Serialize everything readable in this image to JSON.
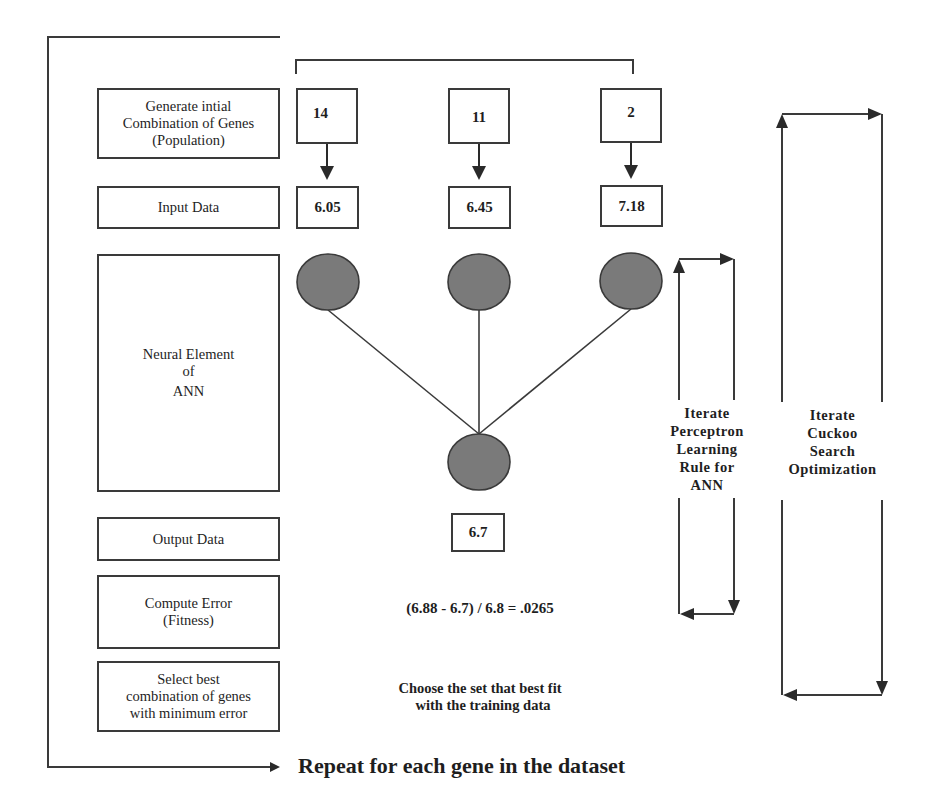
{
  "diagram": {
    "title_bottom": "Repeat for each gene in the dataset",
    "steps": [
      {
        "id": "generate",
        "lines": [
          "Generate intial",
          "Combination of Genes",
          "(Population)"
        ]
      },
      {
        "id": "input",
        "lines": [
          "Input Data"
        ]
      },
      {
        "id": "neural",
        "lines": [
          "Neural Element",
          "of",
          "ANN"
        ]
      },
      {
        "id": "output",
        "lines": [
          "Output Data"
        ]
      },
      {
        "id": "error",
        "lines": [
          "Compute Error",
          "(Fitness)"
        ]
      },
      {
        "id": "select",
        "lines": [
          "Select best",
          "combination of genes",
          "with minimum error"
        ]
      }
    ],
    "genes": [
      "14",
      "11",
      "2"
    ],
    "inputs": [
      "6.05",
      "6.45",
      "7.18"
    ],
    "neurons": {
      "input_count": 3,
      "output_count": 1,
      "fill_color": "#7a7a7a"
    },
    "output_value": "6.7",
    "error_formula": "(6.88 - 6.7) / 6.8 = .0265",
    "select_note": [
      "Choose the set that best fit",
      "with the training data"
    ],
    "loops": {
      "perceptron": [
        "Iterate",
        "Perceptron",
        "Learning",
        "Rule for",
        "ANN"
      ],
      "cuckoo": [
        "Iterate",
        "Cuckoo",
        "Search",
        "Optimization"
      ]
    },
    "colors": {
      "line": "#3a3a3a",
      "neuron": "#7a7a7a",
      "background": "#ffffff"
    }
  }
}
